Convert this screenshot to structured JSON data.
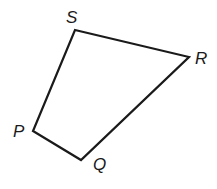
{
  "figure": {
    "type": "quadrilateral",
    "vertices": [
      {
        "label": "S",
        "x": 75,
        "y": 30,
        "lx": 66,
        "ly": 23
      },
      {
        "label": "R",
        "x": 189,
        "y": 57,
        "lx": 195,
        "ly": 64
      },
      {
        "label": "Q",
        "x": 81,
        "y": 160,
        "lx": 93,
        "ly": 170
      },
      {
        "label": "P",
        "x": 33,
        "y": 131,
        "lx": 13,
        "ly": 137
      }
    ],
    "stroke_color": "#1a1a1a"
  }
}
